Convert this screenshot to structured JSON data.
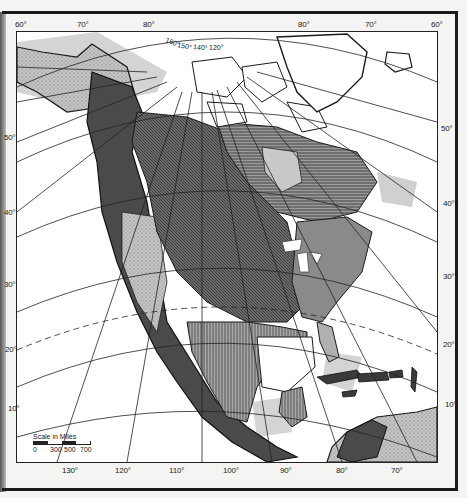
{
  "map": {
    "subject": "North America physiographic relief map",
    "projection": "oblique conic graticule",
    "top_longitude_labels": [
      "60°",
      "70°",
      "80°",
      "80°",
      "70°",
      "60°"
    ],
    "polar_longitude_labels": [
      "160°",
      "150°",
      "140°",
      "120°"
    ],
    "bottom_longitude_labels": [
      "130°",
      "120°",
      "110°",
      "100°",
      "90°",
      "80°",
      "70°"
    ],
    "left_latitude_labels": [
      "50°",
      "40°",
      "30°",
      "20°",
      "10°"
    ],
    "right_latitude_labels": [
      "50°",
      "40°",
      "30°",
      "20°",
      "10°"
    ],
    "tropic_line": "dashed (Tropic of Cancer)",
    "scale": {
      "title": "Scale in Miles",
      "ticks": [
        "0",
        "300",
        "500",
        "700"
      ]
    },
    "colors": {
      "land_dark": "#4a4a4a",
      "land_hatched": "#777777",
      "land_light": "#b8b8b8",
      "shelf": "#d4d4d4",
      "ocean": "#ffffff",
      "ink": "#1a1a1a"
    }
  }
}
